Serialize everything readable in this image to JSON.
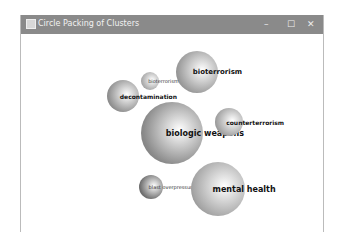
{
  "window": {
    "title": "Circle Packing of Clusters",
    "controls": {
      "minimize": "–",
      "maximize": "☐",
      "close": "✕"
    }
  },
  "clusters": [
    {
      "label": "bioterrorism",
      "cx": 196,
      "cy": 72,
      "r": 21,
      "fontSize": 7,
      "color": "#9a9a9a"
    },
    {
      "label": "bioterrorism",
      "cx": 149,
      "cy": 81,
      "r": 9,
      "fontSize": 5,
      "color": "#a8a8a8"
    },
    {
      "label": "decontamination",
      "cx": 122,
      "cy": 96,
      "r": 16,
      "fontSize": 6,
      "color": "#909090"
    },
    {
      "label": "biologic weapons",
      "cx": 171,
      "cy": 133,
      "r": 31,
      "fontSize": 8,
      "color": "#8a8a8a"
    },
    {
      "label": "counterterrorism",
      "cx": 228,
      "cy": 122,
      "r": 14,
      "fontSize": 6,
      "color": "#a0a0a0"
    },
    {
      "label": "blast overpressure",
      "cx": 150,
      "cy": 187,
      "r": 12,
      "fontSize": 5,
      "color": "#6e6e6e"
    },
    {
      "label": "mental health",
      "cx": 217,
      "cy": 189,
      "r": 27,
      "fontSize": 8,
      "color": "#a5a5a5"
    }
  ]
}
